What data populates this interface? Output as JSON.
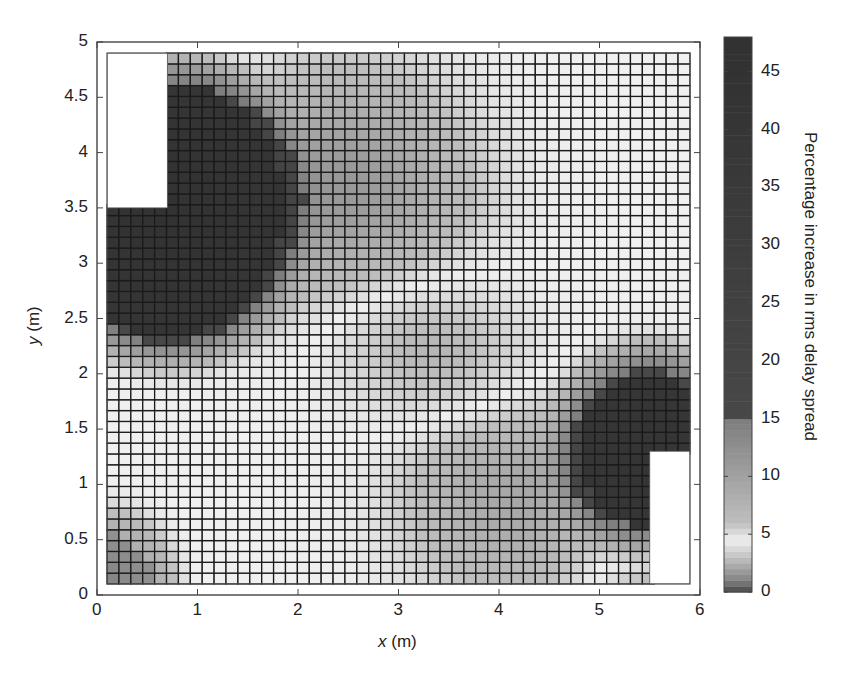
{
  "chart_data": {
    "type": "heatmap",
    "title": "",
    "xlabel": "x (m)",
    "ylabel": "y (m)",
    "colorbar_label": "Percentage increase in rms delay spread",
    "xlim": [
      0,
      6
    ],
    "ylim": [
      0,
      5
    ],
    "x_ticks": [
      "0",
      "1",
      "2",
      "3",
      "4",
      "5",
      "6"
    ],
    "y_ticks": [
      "0",
      "0.5",
      "1",
      "1.5",
      "2",
      "2.5",
      "3",
      "3.5",
      "4",
      "4.5",
      "5"
    ],
    "colorbar_ticks": [
      "0",
      "5",
      "10",
      "15",
      "20",
      "25",
      "30",
      "35",
      "40",
      "45"
    ],
    "colorbar_range": [
      0,
      48
    ],
    "grid": true,
    "grid_extent": {
      "x": [
        0.1,
        5.9
      ],
      "y": [
        0.1,
        4.9
      ]
    },
    "grid_cells": {
      "cols": 49,
      "rows": 49
    },
    "excluded_regions": [
      {
        "name": "obstacle-top-left",
        "x": [
          0.1,
          0.7
        ],
        "y": [
          3.5,
          4.9
        ]
      },
      {
        "name": "obstacle-bottom-right",
        "x": [
          5.5,
          5.9
        ],
        "y": [
          0.1,
          1.3
        ]
      }
    ],
    "high_regions": [
      {
        "name": "around top-left obstacle",
        "approx_value": 40,
        "x": [
          0.1,
          1.6
        ],
        "y": [
          2.8,
          4.9
        ]
      },
      {
        "name": "around bottom-right obstacle",
        "approx_value": 40,
        "x": [
          4.8,
          5.9
        ],
        "y": [
          0.1,
          1.8
        ]
      }
    ],
    "field_sources": [
      {
        "x": 0.7,
        "y": 3.5,
        "radius": 1.15,
        "peak": 45
      },
      {
        "x": 5.5,
        "y": 1.3,
        "radius": 0.7,
        "peak": 42
      },
      {
        "x": 0.1,
        "y": 0.1,
        "radius": 0.45,
        "peak": 14
      }
    ],
    "field_bands": [
      {
        "along": "diag-upper",
        "x": 2.3,
        "y": 3.6,
        "value": 13,
        "spread": 1.1
      },
      {
        "along": "diag-lower",
        "x": 4.3,
        "y": 1.0,
        "value": 11,
        "spread": 1.0
      }
    ],
    "background_value": 4.5
  },
  "colors": {
    "background": "#ffffff",
    "frame": "#444444",
    "gridline": "#1a1a1a"
  }
}
